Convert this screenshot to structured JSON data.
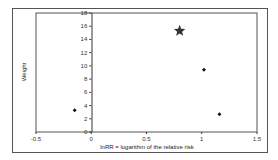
{
  "chart_data": {
    "type": "scatter",
    "title": "",
    "xlabel": "lnRR = logarithm of the relative risk",
    "ylabel": "Weight",
    "xlim": [
      -0.5,
      1.5
    ],
    "ylim": [
      0,
      18
    ],
    "x_ticks": [
      "-0.5",
      "0",
      "0.5",
      "1",
      "1.5"
    ],
    "y_ticks": [
      "0",
      "2",
      "4",
      "6",
      "8",
      "10",
      "12",
      "14",
      "16",
      "18"
    ],
    "grid": false,
    "legend": null,
    "series": [
      {
        "name": "studies",
        "marker": "diamond",
        "points": [
          {
            "x": -0.15,
            "y": 3.3
          },
          {
            "x": 1.02,
            "y": 9.4
          },
          {
            "x": 1.16,
            "y": 2.7
          }
        ]
      },
      {
        "name": "pooled",
        "marker": "star",
        "points": [
          {
            "x": 0.8,
            "y": 15.3
          }
        ]
      }
    ]
  }
}
